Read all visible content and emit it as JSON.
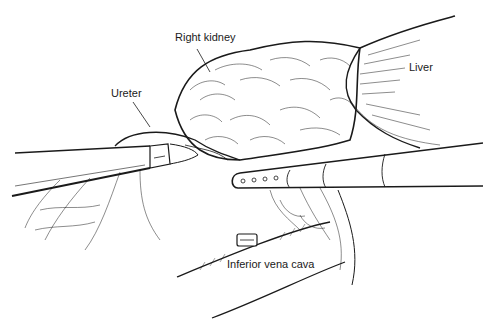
{
  "figure": {
    "type": "surgical line illustration",
    "labels": {
      "right_kidney": "Right kidney",
      "ureter": "Ureter",
      "liver": "Liver",
      "ivc": "Inferior vena cava"
    }
  },
  "colors": {
    "background": "#ffffff",
    "ink": "#1a1a1a"
  }
}
